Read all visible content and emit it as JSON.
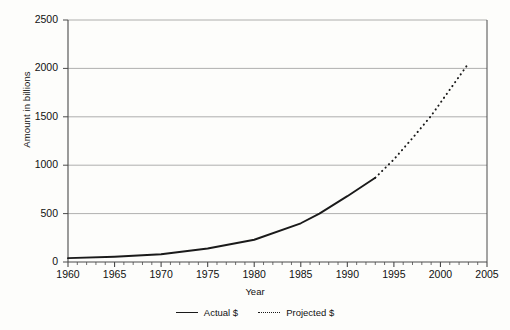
{
  "chart_data": {
    "type": "line",
    "title": "",
    "xlabel": "Year",
    "ylabel": "Amount in billions",
    "xlim": [
      1960,
      2005
    ],
    "ylim": [
      0,
      2500
    ],
    "grid": true,
    "legend_position": "bottom-center",
    "x_ticks": [
      1960,
      1965,
      1970,
      1975,
      1980,
      1985,
      1990,
      1995,
      2000,
      2005
    ],
    "x_minor_tick_interval": 1,
    "y_ticks": [
      0,
      500,
      1000,
      1500,
      2000,
      2500
    ],
    "series": [
      {
        "name": "Actual $",
        "style": "solid",
        "color": "#1a1a1a",
        "x": [
          1960,
          1965,
          1970,
          1975,
          1980,
          1985,
          1987,
          1990,
          1993
        ],
        "values": [
          40,
          55,
          80,
          140,
          230,
          400,
          500,
          680,
          870
        ]
      },
      {
        "name": "Projected $",
        "style": "dotted",
        "color": "#1a1a1a",
        "x": [
          1993,
          1995,
          1997,
          1999,
          2001,
          2003
        ],
        "values": [
          870,
          1060,
          1280,
          1510,
          1780,
          2050
        ]
      }
    ]
  },
  "axes": {
    "y_title": "Amount in billions",
    "x_title": "Year",
    "y_tick_labels": [
      "0",
      "500",
      "1000",
      "1500",
      "2000",
      "2500"
    ],
    "x_tick_labels": [
      "1960",
      "1965",
      "1970",
      "1975",
      "1980",
      "1985",
      "1990",
      "1995",
      "2000",
      "2005"
    ]
  },
  "legend": {
    "entries": [
      {
        "label": "Actual $",
        "style": "solid"
      },
      {
        "label": "Projected $",
        "style": "dotted"
      }
    ]
  },
  "colors": {
    "line": "#1a1a1a",
    "gridline": "#9a9a9a",
    "axis": "#4a4a4a",
    "background": "#fdfdfb"
  }
}
